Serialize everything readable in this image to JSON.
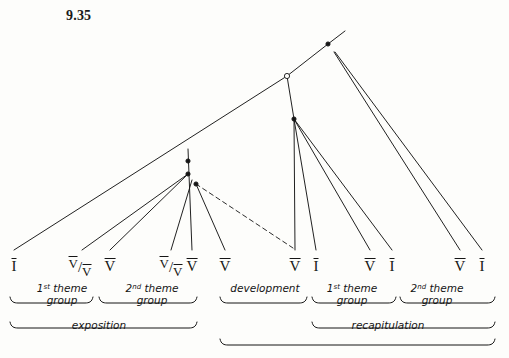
{
  "figure": {
    "number": "9.35",
    "kind": "prolongational tree diagram",
    "background_color": "#fdfdfb",
    "ink_color": "#151515"
  },
  "harmonies": [
    {
      "id": "h1",
      "text": "I",
      "type": "simple",
      "roman": "I",
      "x": 14,
      "y": 258
    },
    {
      "id": "h2",
      "text": "V/V",
      "type": "applied",
      "num": "V",
      "slash": "/",
      "den": "V",
      "x": 80,
      "y": 256
    },
    {
      "id": "h3",
      "text": "V",
      "type": "simple",
      "roman": "V",
      "x": 110,
      "y": 258
    },
    {
      "id": "h4",
      "text": "V/V",
      "type": "applied",
      "num": "V",
      "slash": "/",
      "den": "V",
      "x": 171,
      "y": 256
    },
    {
      "id": "h5",
      "text": "V",
      "type": "simple",
      "roman": "V",
      "x": 192,
      "y": 258
    },
    {
      "id": "h6",
      "text": "V",
      "type": "simple",
      "roman": "V",
      "x": 225,
      "y": 258
    },
    {
      "id": "h7",
      "text": "V",
      "type": "simple",
      "roman": "V",
      "x": 295,
      "y": 258
    },
    {
      "id": "h8",
      "text": "I",
      "type": "simple",
      "roman": "I",
      "x": 316,
      "y": 258
    },
    {
      "id": "h9",
      "text": "V",
      "type": "simple",
      "roman": "V",
      "x": 370,
      "y": 258
    },
    {
      "id": "h10",
      "text": "I",
      "type": "simple",
      "roman": "I",
      "x": 392,
      "y": 258
    },
    {
      "id": "h11",
      "text": "V",
      "type": "simple",
      "roman": "V",
      "x": 460,
      "y": 258
    },
    {
      "id": "h12",
      "text": "I",
      "type": "simple",
      "roman": "I",
      "x": 482,
      "y": 258
    }
  ],
  "group_labels": [
    {
      "id": "g1",
      "line1_pre": "1",
      "line1_sup": "st",
      "line1_post": " theme",
      "line2": "group",
      "x": 62,
      "y": 282
    },
    {
      "id": "g2",
      "line1_pre": "2",
      "line1_sup": "nd",
      "line1_post": " theme",
      "line2": "group",
      "x": 152,
      "y": 282
    },
    {
      "id": "g3",
      "line1_pre": "",
      "line1_sup": "",
      "line1_post": "development",
      "line2": "",
      "x": 265,
      "y": 282
    },
    {
      "id": "g4",
      "line1_pre": "1",
      "line1_sup": "st",
      "line1_post": " theme",
      "line2": "group",
      "x": 352,
      "y": 282
    },
    {
      "id": "g5",
      "line1_pre": "2",
      "line1_sup": "nd",
      "line1_post": " theme",
      "line2": "group",
      "x": 437,
      "y": 282
    }
  ],
  "section_labels": [
    {
      "id": "s1",
      "text": "exposition",
      "x": 99,
      "y": 319
    },
    {
      "id": "s2",
      "text": "recapitulation",
      "x": 388,
      "y": 319
    }
  ],
  "brackets": [
    {
      "id": "b-theme1-exp",
      "label": "1st theme group (exposition)",
      "x1": 10,
      "x2": 93,
      "y": 303
    },
    {
      "id": "b-theme2-exp",
      "label": "2nd theme group (exposition)",
      "x1": 99,
      "x2": 197,
      "y": 303
    },
    {
      "id": "b-exposition",
      "label": "exposition",
      "x1": 10,
      "x2": 197,
      "y": 328
    },
    {
      "id": "b-development",
      "label": "development",
      "x1": 220,
      "x2": 307,
      "y": 303
    },
    {
      "id": "b-theme1-rec",
      "label": "1st theme group (recap)",
      "x1": 312,
      "x2": 396,
      "y": 303
    },
    {
      "id": "b-theme2-rec",
      "label": "2nd theme group (recap)",
      "x1": 400,
      "x2": 495,
      "y": 303
    },
    {
      "id": "b-recap",
      "label": "recapitulation",
      "x1": 312,
      "x2": 495,
      "y": 328
    },
    {
      "id": "b-dev-recap",
      "label": "development + recapitulation",
      "x1": 220,
      "x2": 495,
      "y": 345
    }
  ],
  "nodes": [
    {
      "id": "n-root",
      "label": "root node",
      "x": 328,
      "y": 44,
      "filled": true
    },
    {
      "id": "n-open",
      "label": "open circle node",
      "x": 287,
      "y": 76,
      "filled": false
    },
    {
      "id": "n-dev-recap",
      "label": "development branch node",
      "x": 294,
      "y": 119,
      "filled": true
    },
    {
      "id": "n-exp-top",
      "label": "exposition top node",
      "x": 188,
      "y": 161,
      "filled": true
    },
    {
      "id": "n-exp-mid",
      "label": "exposition middle node",
      "x": 188,
      "y": 174,
      "filled": true
    },
    {
      "id": "n-exp-low",
      "label": "exposition lower node",
      "x": 196,
      "y": 184,
      "filled": true
    }
  ],
  "branches": [
    {
      "id": "br-root-up",
      "from": "root-apex",
      "to": "root",
      "style": "solid",
      "x1": 345,
      "y1": 31,
      "x2": 328,
      "y2": 44
    },
    {
      "id": "br-root-left",
      "from": "root",
      "to": "open",
      "style": "solid",
      "x1": 328,
      "y1": 44,
      "x2": 287,
      "y2": 76
    },
    {
      "id": "br-open-left",
      "from": "open",
      "to": "h1",
      "style": "solid",
      "x1": 287,
      "y1": 76,
      "x2": 14,
      "y2": 250
    },
    {
      "id": "br-open-down",
      "from": "open",
      "to": "n-dev-recap",
      "style": "solid",
      "x1": 287,
      "y1": 76,
      "x2": 294,
      "y2": 119
    },
    {
      "id": "br-dev-h7",
      "from": "n-dev-recap",
      "to": "h7",
      "style": "solid",
      "x1": 294,
      "y1": 119,
      "x2": 295,
      "y2": 250
    },
    {
      "id": "br-dev-h8",
      "from": "n-dev-recap",
      "to": "h8",
      "style": "solid",
      "x1": 294,
      "y1": 119,
      "x2": 316,
      "y2": 250
    },
    {
      "id": "br-dev-h9",
      "from": "n-dev-recap",
      "to": "h9",
      "style": "solid",
      "x1": 294,
      "y1": 119,
      "x2": 370,
      "y2": 250
    },
    {
      "id": "br-dev-h10",
      "from": "n-dev-recap",
      "to": "h10",
      "style": "solid",
      "x1": 294,
      "y1": 119,
      "x2": 392,
      "y2": 250
    },
    {
      "id": "br-root-h11",
      "from": "root",
      "to": "h11",
      "style": "solid",
      "x1": 334,
      "y1": 52,
      "x2": 460,
      "y2": 250
    },
    {
      "id": "br-root-h12",
      "from": "root",
      "to": "h12",
      "style": "solid",
      "x1": 335,
      "y1": 52,
      "x2": 482,
      "y2": 250
    },
    {
      "id": "br-exp-stem",
      "from": "n-exp-top",
      "to": "h5",
      "style": "solid",
      "x1": 188,
      "y1": 149,
      "x2": 192,
      "y2": 250
    },
    {
      "id": "br-exp-h2",
      "from": "n-exp-mid",
      "to": "h2",
      "style": "solid",
      "x1": 188,
      "y1": 174,
      "x2": 82,
      "y2": 250
    },
    {
      "id": "br-exp-h3",
      "from": "n-exp-mid",
      "to": "h3",
      "style": "solid",
      "x1": 188,
      "y1": 174,
      "x2": 110,
      "y2": 250
    },
    {
      "id": "br-exp-h4",
      "from": "n-exp-low",
      "to": "h4",
      "style": "solid",
      "x1": 192,
      "y1": 180,
      "x2": 171,
      "y2": 250
    },
    {
      "id": "br-exp-h6",
      "from": "n-exp-low",
      "to": "h6",
      "style": "solid",
      "x1": 196,
      "y1": 184,
      "x2": 225,
      "y2": 250
    },
    {
      "id": "br-exp-dashed",
      "from": "n-exp-low",
      "to": "h7",
      "style": "dashed",
      "x1": 196,
      "y1": 184,
      "x2": 293,
      "y2": 248
    }
  ]
}
